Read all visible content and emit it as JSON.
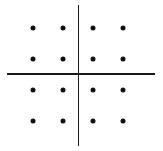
{
  "diagram": {
    "type": "constellation",
    "grid": "4x4",
    "colors": {
      "axis": "#1a1a1a",
      "point": "#111111",
      "background": "#ffffff"
    },
    "axes": {
      "horizontal": {
        "x1": 7,
        "x2": 155,
        "y": 74
      },
      "vertical": {
        "x": 78,
        "y1": 5,
        "y2": 146
      }
    },
    "points": [
      {
        "x": 33,
        "y": 28
      },
      {
        "x": 63,
        "y": 28
      },
      {
        "x": 93,
        "y": 28
      },
      {
        "x": 123,
        "y": 28
      },
      {
        "x": 33,
        "y": 59
      },
      {
        "x": 63,
        "y": 59
      },
      {
        "x": 93,
        "y": 59
      },
      {
        "x": 123,
        "y": 59
      },
      {
        "x": 33,
        "y": 90
      },
      {
        "x": 63,
        "y": 90
      },
      {
        "x": 93,
        "y": 90
      },
      {
        "x": 123,
        "y": 90
      },
      {
        "x": 33,
        "y": 121
      },
      {
        "x": 63,
        "y": 121
      },
      {
        "x": 93,
        "y": 121
      },
      {
        "x": 123,
        "y": 121
      }
    ]
  }
}
